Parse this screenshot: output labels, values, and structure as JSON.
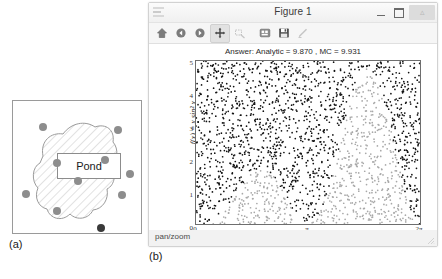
{
  "panel_a": {
    "caption": "(a)",
    "region_label": "Pond",
    "name": "pond-diagram",
    "dot_color": "#8d8d8d",
    "dark_dot_color": "#3a3a3a",
    "dots": [
      {
        "x": 26,
        "y": 22,
        "dark": false
      },
      {
        "x": 101,
        "y": 25,
        "dark": false
      },
      {
        "x": 40,
        "y": 58,
        "dark": false
      },
      {
        "x": 88,
        "y": 55,
        "dark": false
      },
      {
        "x": 113,
        "y": 69,
        "dark": false
      },
      {
        "x": 9,
        "y": 89,
        "dark": false
      },
      {
        "x": 61,
        "y": 76,
        "dark": false
      },
      {
        "x": 105,
        "y": 90,
        "dark": false
      },
      {
        "x": 40,
        "y": 106,
        "dark": false
      },
      {
        "x": 84,
        "y": 123,
        "dark": true
      }
    ]
  },
  "figure_window": {
    "title": "Figure 1",
    "icon": "app-icon",
    "window_controls": [
      {
        "name": "minimize-button",
        "glyph": "—"
      },
      {
        "name": "maximize-button",
        "glyph": "❐"
      },
      {
        "name": "close-button",
        "glyph": "✕"
      }
    ],
    "toolbar": [
      {
        "name": "home-icon",
        "label": "Home",
        "state": "enabled"
      },
      {
        "name": "back-arrow-icon",
        "label": "Back",
        "state": "enabled"
      },
      {
        "name": "forward-arrow-icon",
        "label": "Forward",
        "state": "enabled"
      },
      {
        "name": "pan-move-icon",
        "label": "Pan/Zoom",
        "state": "active"
      },
      {
        "name": "zoom-rect-icon",
        "label": "Zoom to rectangle",
        "state": "dim"
      },
      {
        "name": "configure-subplots-icon",
        "label": "Configure subplots",
        "state": "enabled"
      },
      {
        "name": "save-figure-icon",
        "label": "Save figure",
        "state": "enabled"
      },
      {
        "name": "edit-axis-icon",
        "label": "Edit axis",
        "state": "dim"
      }
    ],
    "status_text": "pan/zoom",
    "caption": "(b)"
  },
  "chart_data": {
    "type": "scatter",
    "title": "Answer: Analytic = 9.870 , MC = 9.931",
    "xlabel": "x",
    "ylabel": "f(x) = x sin² x",
    "xlim": [
      0,
      6.283185307179586
    ],
    "ylim": [
      0,
      5
    ],
    "grid": false,
    "legend": null,
    "xtick_labels": [
      "0",
      "π",
      "2π"
    ],
    "xtick_values": [
      0,
      3.141592653589793,
      6.283185307179586
    ],
    "ytick_labels": [
      "0",
      "1",
      "2",
      "3",
      "4",
      "5"
    ],
    "ytick_values": [
      0,
      1,
      2,
      3,
      4,
      5
    ],
    "n_points": 2000,
    "series": [
      {
        "name": "points above f(x)",
        "color": "#111111",
        "marker": "."
      },
      {
        "name": "points below f(x)",
        "color": "#a8a8a8",
        "marker": "."
      }
    ],
    "function": "f(x) = x * sin(x)^2",
    "annotations": [
      {
        "name": "analytic-value",
        "label": "Analytic",
        "value": 9.87
      },
      {
        "name": "monte-carlo-value",
        "label": "MC",
        "value": 9.931
      }
    ]
  }
}
